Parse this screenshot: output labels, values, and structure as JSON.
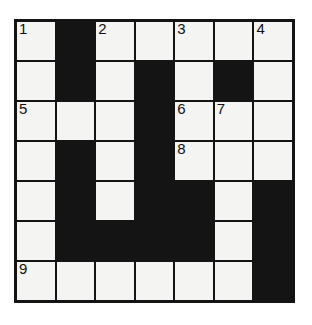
{
  "puzzle": {
    "type": "crossword-grid",
    "rows": 7,
    "cols": 7,
    "colors": {
      "block": "#141414",
      "cell": "#f4f4f2",
      "border": "#141414",
      "number": "#111111",
      "page_background": "#ffffff"
    },
    "grid": [
      [
        {
          "block": false,
          "number": "1",
          "letter": ""
        },
        {
          "block": true,
          "number": "",
          "letter": ""
        },
        {
          "block": false,
          "number": "2",
          "letter": ""
        },
        {
          "block": false,
          "number": "",
          "letter": ""
        },
        {
          "block": false,
          "number": "3",
          "letter": ""
        },
        {
          "block": false,
          "number": "",
          "letter": ""
        },
        {
          "block": false,
          "number": "4",
          "letter": ""
        }
      ],
      [
        {
          "block": false,
          "number": "",
          "letter": ""
        },
        {
          "block": true,
          "number": "",
          "letter": ""
        },
        {
          "block": false,
          "number": "",
          "letter": ""
        },
        {
          "block": true,
          "number": "",
          "letter": ""
        },
        {
          "block": false,
          "number": "",
          "letter": ""
        },
        {
          "block": true,
          "number": "",
          "letter": ""
        },
        {
          "block": false,
          "number": "",
          "letter": ""
        }
      ],
      [
        {
          "block": false,
          "number": "5",
          "letter": ""
        },
        {
          "block": false,
          "number": "",
          "letter": ""
        },
        {
          "block": false,
          "number": "",
          "letter": ""
        },
        {
          "block": true,
          "number": "",
          "letter": ""
        },
        {
          "block": false,
          "number": "6",
          "letter": ""
        },
        {
          "block": false,
          "number": "7",
          "letter": ""
        },
        {
          "block": false,
          "number": "",
          "letter": ""
        }
      ],
      [
        {
          "block": false,
          "number": "",
          "letter": ""
        },
        {
          "block": true,
          "number": "",
          "letter": ""
        },
        {
          "block": false,
          "number": "",
          "letter": ""
        },
        {
          "block": true,
          "number": "",
          "letter": ""
        },
        {
          "block": false,
          "number": "8",
          "letter": ""
        },
        {
          "block": false,
          "number": "",
          "letter": ""
        },
        {
          "block": false,
          "number": "",
          "letter": ""
        }
      ],
      [
        {
          "block": false,
          "number": "",
          "letter": ""
        },
        {
          "block": true,
          "number": "",
          "letter": ""
        },
        {
          "block": false,
          "number": "",
          "letter": ""
        },
        {
          "block": true,
          "number": "",
          "letter": ""
        },
        {
          "block": true,
          "number": "",
          "letter": ""
        },
        {
          "block": false,
          "number": "",
          "letter": ""
        },
        {
          "block": true,
          "number": "",
          "letter": ""
        }
      ],
      [
        {
          "block": false,
          "number": "",
          "letter": ""
        },
        {
          "block": true,
          "number": "",
          "letter": ""
        },
        {
          "block": true,
          "number": "",
          "letter": ""
        },
        {
          "block": true,
          "number": "",
          "letter": ""
        },
        {
          "block": true,
          "number": "",
          "letter": ""
        },
        {
          "block": false,
          "number": "",
          "letter": ""
        },
        {
          "block": true,
          "number": "",
          "letter": ""
        }
      ],
      [
        {
          "block": false,
          "number": "9",
          "letter": ""
        },
        {
          "block": false,
          "number": "",
          "letter": ""
        },
        {
          "block": false,
          "number": "",
          "letter": ""
        },
        {
          "block": false,
          "number": "",
          "letter": ""
        },
        {
          "block": false,
          "number": "",
          "letter": ""
        },
        {
          "block": false,
          "number": "",
          "letter": ""
        },
        {
          "block": true,
          "number": "",
          "letter": ""
        }
      ]
    ]
  }
}
